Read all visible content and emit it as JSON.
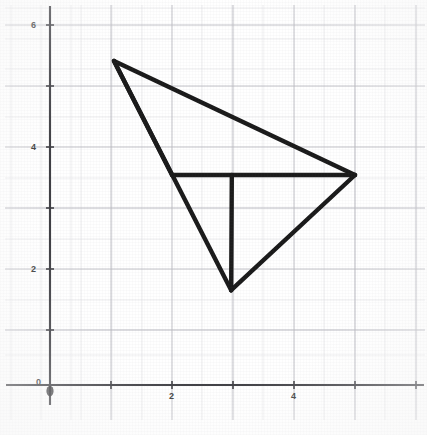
{
  "chart_data": {
    "type": "line",
    "title": "",
    "subtitle": "",
    "xlabel": "",
    "ylabel": "",
    "xlim": [
      -0.5,
      6.2
    ],
    "ylim": [
      -0.55,
      6.9
    ],
    "grid": true,
    "grid_minor": true,
    "grid_major_step": 1,
    "legend": "none",
    "background_color": "#ffffff",
    "line_color": "#1a1a1a",
    "axis_color": "#4a4a4a",
    "grid_color": "#c8c8cc",
    "xticks": [
      0,
      2,
      4
    ],
    "xtick_labels": [
      "0",
      "2",
      "4"
    ],
    "yticks": [
      0,
      2,
      4,
      6
    ],
    "ytick_labels": [
      "0",
      "2",
      "4",
      "6"
    ],
    "points": {
      "apex": {
        "label": "apex",
        "x": 1.05,
        "y": 5.4
      },
      "right": {
        "label": "right",
        "x": 5.0,
        "y": 3.5
      },
      "bottom": {
        "label": "bottom",
        "x": 2.97,
        "y": 1.58
      },
      "center": {
        "label": "center",
        "x": 2.98,
        "y": 3.5
      },
      "left_mid": {
        "label": "left-mid",
        "x": 2.0,
        "y": 3.5
      }
    },
    "series": [
      {
        "name": "edge-apex-right",
        "x": [
          1.05,
          5.0
        ],
        "y": [
          5.4,
          3.5
        ]
      },
      {
        "name": "edge-apex-left-mid",
        "x": [
          1.05,
          2.0
        ],
        "y": [
          5.4,
          3.5
        ]
      },
      {
        "name": "edge-apex-bottom",
        "x": [
          1.05,
          2.97
        ],
        "y": [
          5.4,
          1.58
        ]
      },
      {
        "name": "edge-left-mid-right",
        "x": [
          2.0,
          5.0
        ],
        "y": [
          3.5,
          3.5
        ]
      },
      {
        "name": "edge-center-bottom",
        "x": [
          2.98,
          2.97
        ],
        "y": [
          3.5,
          1.58
        ]
      },
      {
        "name": "edge-bottom-right",
        "x": [
          2.97,
          5.0
        ],
        "y": [
          1.58,
          3.5
        ]
      }
    ]
  },
  "axes": {
    "x_axis_name": "x-axis",
    "y_axis_name": "y-axis",
    "origin_label": "0"
  }
}
